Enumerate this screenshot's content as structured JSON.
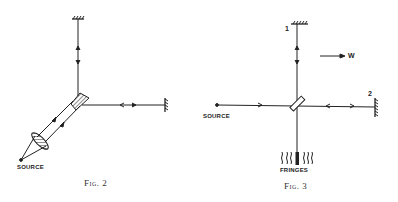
{
  "figures": [
    {
      "id": "fig2",
      "caption": "Fig. 2",
      "labels": {
        "source": "SOURCE"
      },
      "elements": [
        "top-mirror",
        "right-mirror",
        "beam-splitter-hatched",
        "lens",
        "source-point",
        "diagonal-double-beam",
        "direction-arrows"
      ]
    },
    {
      "id": "fig3",
      "caption": "Fig. 3",
      "labels": {
        "source": "SOURCE",
        "fringes": "FRINGES",
        "mirror_1": "1",
        "mirror_2": "2",
        "wind": "W"
      },
      "elements": [
        "top-mirror-1",
        "right-mirror-2",
        "beam-splitter-plate",
        "source-point",
        "fringes-pattern",
        "wind-arrow",
        "direction-arrows"
      ]
    }
  ],
  "colors": {
    "ink": "#222222",
    "background": "#ffffff"
  }
}
